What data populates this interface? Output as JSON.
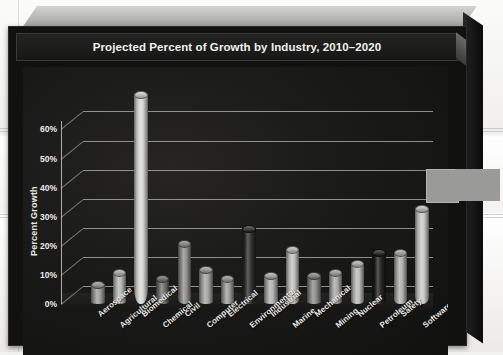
{
  "chart_data": {
    "type": "bar",
    "title": "Projected Percent of Growth by Industry, 2010–2020",
    "xlabel": "",
    "ylabel": "Percent Growth",
    "ylim": [
      0,
      70
    ],
    "grid": true,
    "legend": "none",
    "ytick_labels": [
      "60%",
      "50%",
      "40%",
      "30%",
      "20%",
      "10%",
      "0%"
    ],
    "ytick_values": [
      60,
      50,
      40,
      30,
      20,
      10,
      0
    ],
    "categories": [
      "Aerospace",
      "Agricultural",
      "Biomedical",
      "Chemical",
      "Civil",
      "Computer",
      "Electrical",
      "Environmental",
      "Industrial",
      "Marine",
      "Mechanical",
      "Mining",
      "Nuclear",
      "Petroleum",
      "Safety",
      "Software"
    ],
    "values": [
      7,
      11,
      72,
      9,
      21,
      12,
      9,
      26,
      10,
      19,
      10,
      11,
      14,
      18,
      18,
      33
    ],
    "bar_style": "3d-cylinder",
    "bar_colors": [
      "#9b9b97",
      "#b4b4b0",
      "#d6d6d2",
      "#6f6f6c",
      "#8c8c88",
      "#a2a29e",
      "#9a9a96",
      "#2b2b29",
      "#b0b0ac",
      "#c0c0bc",
      "#8a8a86",
      "#a6a6a2",
      "#b8b8b4",
      "#1d1d1c",
      "#aeaeaa",
      "#c8c8c4"
    ]
  },
  "overlay": {
    "gray_block_label": "selection-artifact"
  },
  "colors": {
    "panel_background": "#1a1a18",
    "title_background": "#1b1b1a",
    "text": "#f2f2f0",
    "gridline": "#d7d7d2",
    "frame_top": "#b7b7b4",
    "frame_side": "#141414"
  }
}
